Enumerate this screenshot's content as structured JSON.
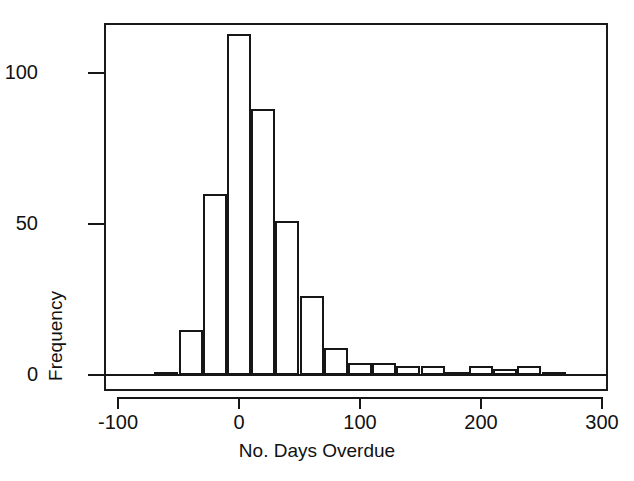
{
  "chart_data": {
    "type": "bar",
    "title": "",
    "subtitle": "",
    "xlabel": "No. Days Overdue",
    "ylabel": "Frequency",
    "xlim": [
      -100,
      300
    ],
    "ylim": [
      0,
      118
    ],
    "grid": false,
    "legend": null,
    "bin_width": 20,
    "x_tick_labels": [
      "-100",
      "0",
      "100",
      "200",
      "300"
    ],
    "x_ticks": [
      -100,
      0,
      100,
      200,
      300
    ],
    "y_tick_labels": [
      "0",
      "50",
      "100"
    ],
    "y_ticks": [
      0,
      50,
      100
    ],
    "bar_style": {
      "fill": "#ffffff",
      "stroke": "#161616"
    },
    "categories": [
      "-70 to -50",
      "-50 to -30",
      "-30 to -10",
      "-10 to 10",
      "10 to 30",
      "30 to 50",
      "50 to 70",
      "70 to 90",
      "90 to 110",
      "110 to 130",
      "130 to 150",
      "150 to 170",
      "170 to 190",
      "190 to 210",
      "210 to 230",
      "230 to 250",
      "250 to 270",
      "270 to 290"
    ],
    "bin_starts": [
      -70,
      -50,
      -30,
      -10,
      10,
      30,
      50,
      70,
      90,
      110,
      130,
      150,
      170,
      190,
      210,
      230,
      250,
      270
    ],
    "values": [
      1,
      15,
      60,
      113,
      88,
      51,
      26,
      9,
      4,
      4,
      3,
      3,
      1,
      3,
      2,
      3,
      1,
      0
    ]
  },
  "axes": {
    "x_title": "No. Days Overdue",
    "y_title": "Frequency",
    "x_ticks": [
      {
        "label": "-100",
        "value": -100
      },
      {
        "label": "0",
        "value": 0
      },
      {
        "label": "100",
        "value": 100
      },
      {
        "label": "200",
        "value": 200
      },
      {
        "label": "300",
        "value": 300
      }
    ],
    "y_ticks": [
      {
        "label": "0",
        "value": 0
      },
      {
        "label": "50",
        "value": 50
      },
      {
        "label": "100",
        "value": 100
      }
    ]
  },
  "colors": {
    "ink": "#161616",
    "background": "#ffffff"
  }
}
